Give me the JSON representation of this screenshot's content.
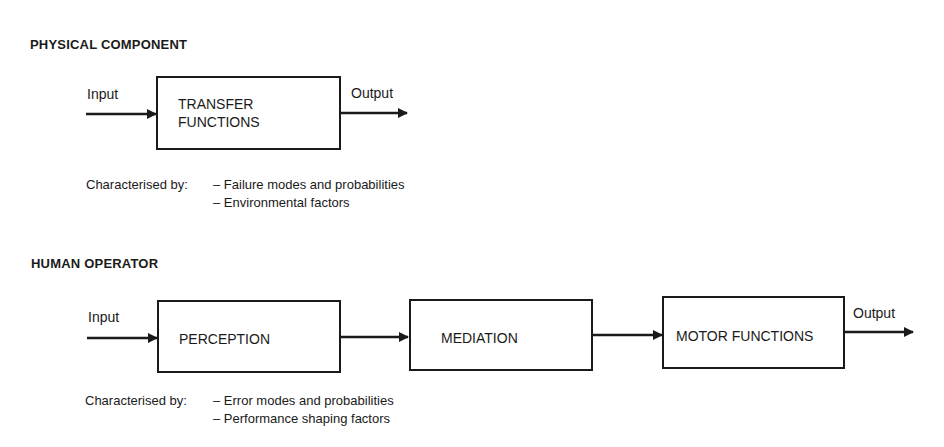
{
  "sections": [
    {
      "title": "PHYSICAL COMPONENT",
      "input_label": "Input",
      "output_label": "Output",
      "blocks": [
        {
          "line1": "TRANSFER",
          "line2": "FUNCTIONS"
        }
      ],
      "characterised_prefix": "Characterised by:",
      "characteristics": [
        "– Failure modes and probabilities",
        "– Environmental factors"
      ]
    },
    {
      "title": "HUMAN OPERATOR",
      "input_label": "Input",
      "output_label": "Output",
      "blocks": [
        {
          "label": "PERCEPTION"
        },
        {
          "label": "MEDIATION"
        },
        {
          "label": "MOTOR FUNCTIONS"
        }
      ],
      "characterised_prefix": "Characterised by:",
      "characteristics": [
        "– Error modes and probabilities",
        "– Performance shaping factors"
      ]
    }
  ]
}
